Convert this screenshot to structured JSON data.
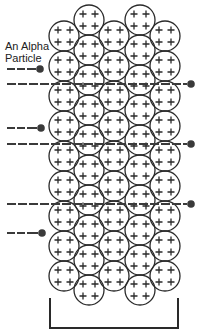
{
  "diagram": {
    "label_line1": "An Alpha",
    "label_line2": "Particle",
    "atom_symbol": "+",
    "colors": {
      "stroke": "#2a2a2a",
      "background": "#ffffff"
    },
    "lattice": {
      "columns": [
        {
          "cx": 64,
          "first_cy": 36,
          "count": 9
        },
        {
          "cx": 89,
          "first_cy": 20,
          "count": 10
        },
        {
          "cx": 114,
          "first_cy": 36,
          "count": 9
        },
        {
          "cx": 140,
          "first_cy": 20,
          "count": 10
        },
        {
          "cx": 165,
          "first_cy": 36,
          "count": 9
        }
      ],
      "pitch": 30,
      "radius": 15
    },
    "particles": [
      {
        "y": 69,
        "x_start": 7,
        "x_end": 40,
        "type": "incoming"
      },
      {
        "y": 84,
        "x_start": 7,
        "x_end": 191,
        "type": "passing"
      },
      {
        "y": 128,
        "x_start": 7,
        "x_end": 41,
        "type": "incoming"
      },
      {
        "y": 144,
        "x_start": 7,
        "x_end": 191,
        "type": "passing"
      },
      {
        "y": 204,
        "x_start": 7,
        "x_end": 191,
        "type": "passing"
      },
      {
        "y": 233,
        "x_start": 7,
        "x_end": 42,
        "type": "incoming"
      }
    ],
    "bracket": {
      "x1": 50,
      "x2": 178,
      "y_top": 298,
      "y_bottom": 328
    }
  }
}
